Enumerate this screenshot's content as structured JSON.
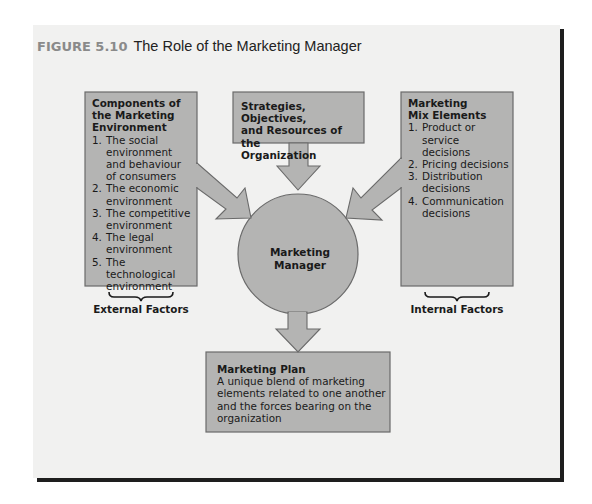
{
  "figure": {
    "label": "FIGURE 5.10",
    "title": "The Role of the Marketing Manager"
  },
  "colors": {
    "panel_bg": "#f1f1f0",
    "box_fill": "#b4b4b3",
    "box_border": "#6a6a6a",
    "shadow": "#1e1e1e",
    "figure_label": "#8a8a8a"
  },
  "external_box": {
    "heading": "Components of the Marketing Environment",
    "heading_lines": [
      "Components of",
      "the Marketing",
      "Environment"
    ],
    "items": [
      {
        "num": "1.",
        "lines": [
          "The social",
          "environment",
          "and behaviour",
          "of consumers"
        ]
      },
      {
        "num": "2.",
        "lines": [
          "The economic",
          "environment"
        ]
      },
      {
        "num": "3.",
        "lines": [
          "The competitive",
          "environment"
        ]
      },
      {
        "num": "4.",
        "lines": [
          "The legal",
          "environment"
        ]
      },
      {
        "num": "5.",
        "lines": [
          "The technological",
          "environment"
        ]
      }
    ],
    "footer_label": "External Factors"
  },
  "top_box": {
    "heading_lines": [
      "Strategies, Objectives,",
      "and Resources of the",
      "Organization"
    ]
  },
  "internal_box": {
    "heading_lines": [
      "Marketing",
      "Mix Elements"
    ],
    "items": [
      {
        "num": "1.",
        "lines": [
          "Product or service",
          "decisions"
        ]
      },
      {
        "num": "2.",
        "lines": [
          "Pricing decisions"
        ]
      },
      {
        "num": "3.",
        "lines": [
          "Distribution",
          "decisions"
        ]
      },
      {
        "num": "4.",
        "lines": [
          "Communication",
          "decisions"
        ]
      }
    ],
    "footer_label": "Internal Factors"
  },
  "center": {
    "lines": [
      "Marketing",
      "Manager"
    ]
  },
  "plan_box": {
    "heading": "Marketing Plan",
    "lines": [
      "A unique blend of marketing",
      "elements related to one another",
      "and the forces bearing on the",
      "organization"
    ]
  }
}
